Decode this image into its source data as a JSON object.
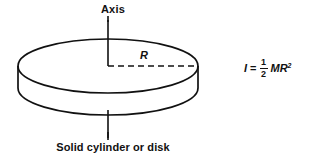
{
  "figure": {
    "kind": "moment-of-inertia-diagram",
    "background_color": "#ffffff",
    "stroke_color": "#111111",
    "labels": {
      "axis": "Axis",
      "radius": "R",
      "body": "Solid cylinder or disk"
    },
    "formula": {
      "symbol": "I",
      "equals": "=",
      "fraction_numerator": "1",
      "fraction_denominator": "2",
      "term": "MR",
      "exponent": "2",
      "plain_text": "I = 1/2 MR²"
    },
    "geometry": {
      "top_ellipse_center_x": 108,
      "top_ellipse_center_y": 66,
      "top_ellipse_rx": 90,
      "top_ellipse_ry": 27,
      "bottom_ellipse_center_y": 88,
      "axis_top_y": 20,
      "axis_bottom_y": 138,
      "radius_dash_start_x": 108,
      "radius_dash_end_x": 198,
      "radius_dash_y": 66
    }
  }
}
